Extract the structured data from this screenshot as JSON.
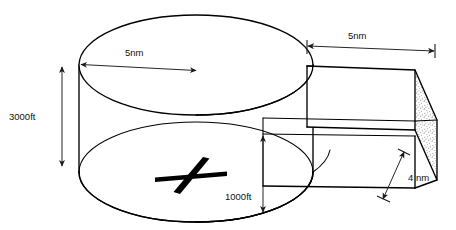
{
  "figure": {
    "title": "",
    "background_color": "#ffffff",
    "line_color": "#000000",
    "shading": "stipple-dots",
    "objects": [
      {
        "name": "cylinder",
        "description": "large flat cylinder (disc) shown in oblique view, stippled side wall"
      },
      {
        "name": "box",
        "description": "rectangular box (cuboid) abutting the right side of the cylinder, stippled right end face"
      },
      {
        "name": "cross-marker",
        "description": "bold slanted cross marker on the base of the cylinder"
      }
    ]
  },
  "dimensions": {
    "cylinder_height": {
      "label": "3000ft",
      "icon": "double-arrow-vertical",
      "position": "left of cylinder"
    },
    "cylinder_radius": {
      "label": "5nm",
      "icon": "double-arrow-horizontal",
      "position": "across top face of cylinder"
    },
    "box_length": {
      "label": "5nm",
      "icon": "double-arrow-horizontal",
      "position": "above box"
    },
    "box_height": {
      "label": "1000ft",
      "icon": "double-arrow-vertical",
      "position": "lower centre, at box left face"
    },
    "box_depth": {
      "label": "4 nm",
      "icon": "double-arrow-diagonal",
      "position": "lower right of box"
    }
  },
  "colors": {
    "ink": "#000000",
    "dimension_ink": "#1a1a1a",
    "paper": "#ffffff",
    "stipple": "#4d4d4d"
  }
}
